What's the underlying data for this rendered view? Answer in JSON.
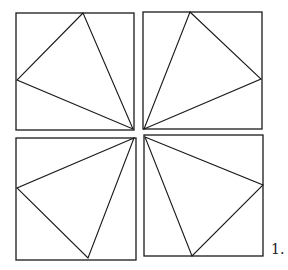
{
  "figure": {
    "label": "1.",
    "stroke_color": "#1a1a1a",
    "background": "#ffffff",
    "panels": [
      {
        "name": "top-left",
        "square": [
          16,
          13,
          118,
          117
        ],
        "triangle": [
          [
            83,
            13
          ],
          [
            17,
            80
          ],
          [
            133,
            129
          ]
        ]
      },
      {
        "name": "top-right",
        "square": [
          143,
          12,
          119,
          117
        ],
        "triangle": [
          [
            190,
            12
          ],
          [
            261,
            79
          ],
          [
            144,
            129
          ]
        ]
      },
      {
        "name": "bottom-left",
        "square": [
          16,
          138,
          120,
          122
        ],
        "triangle": [
          [
            134,
            138
          ],
          [
            17,
            188
          ],
          [
            88,
            258
          ]
        ]
      },
      {
        "name": "bottom-right",
        "square": [
          144,
          135,
          119,
          121
        ],
        "triangle": [
          [
            145,
            137
          ],
          [
            263,
            185
          ],
          [
            192,
            256
          ]
        ]
      }
    ]
  }
}
